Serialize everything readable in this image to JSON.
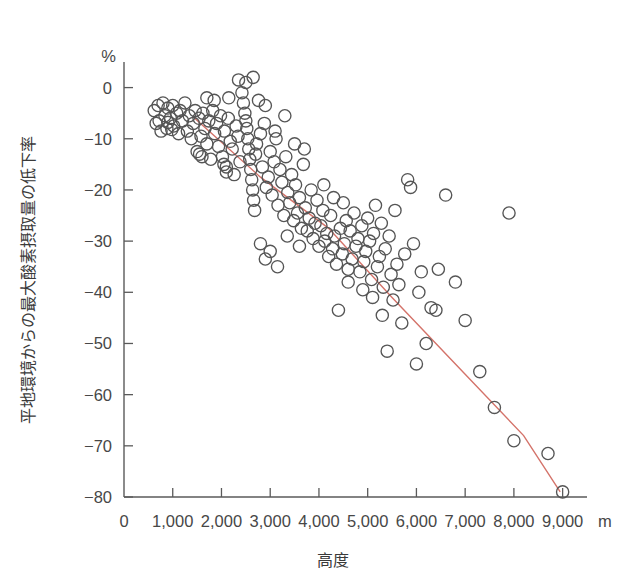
{
  "chart_data": {
    "type": "scatter",
    "title": "",
    "xlabel": "高度",
    "ylabel": "平地環境からの最大酸素摂取量の低下率",
    "x_unit": "m",
    "y_unit": "%",
    "xlim": [
      0,
      9500
    ],
    "ylim": [
      -80,
      5
    ],
    "grid": false,
    "legend": "none",
    "x_ticks": [
      0,
      1000,
      2000,
      3000,
      4000,
      5000,
      6000,
      7000,
      8000,
      9000
    ],
    "x_tick_labels": [
      "0",
      "1,000",
      "2,000",
      "3,000",
      "4,000",
      "5,000",
      "6,000",
      "7,000",
      "8,000",
      "9,000"
    ],
    "y_ticks": [
      0,
      -10,
      -20,
      -30,
      -40,
      -50,
      -60,
      -70,
      -80
    ],
    "y_tick_labels": [
      "0",
      "-10",
      "-20",
      "-30",
      "-40",
      "-50",
      "-60",
      "-70",
      "-80"
    ],
    "series": [
      {
        "name": "最大酸素摂取量低下率",
        "marker": "open-circle",
        "marker_color": "#555555",
        "points": [
          [
            620,
            -4.5
          ],
          [
            660,
            -7.0
          ],
          [
            700,
            -3.5
          ],
          [
            720,
            -6.5
          ],
          [
            760,
            -8.5
          ],
          [
            800,
            -3.0
          ],
          [
            840,
            -5.5
          ],
          [
            880,
            -8.0
          ],
          [
            900,
            -4.0
          ],
          [
            950,
            -6.0
          ],
          [
            1000,
            -3.5
          ],
          [
            1020,
            -7.5
          ],
          [
            1080,
            -5.0
          ],
          [
            1120,
            -9.0
          ],
          [
            1150,
            -4.5
          ],
          [
            1200,
            -6.5
          ],
          [
            1250,
            -3.0
          ],
          [
            1300,
            -8.5
          ],
          [
            1340,
            -5.5
          ],
          [
            1380,
            -10.0
          ],
          [
            1420,
            -7.0
          ],
          [
            1460,
            -4.5
          ],
          [
            1500,
            -12.5
          ],
          [
            1540,
            -6.0
          ],
          [
            1580,
            -9.5
          ],
          [
            1620,
            -5.0
          ],
          [
            1660,
            -8.0
          ],
          [
            1700,
            -11.0
          ],
          [
            1740,
            -6.5
          ],
          [
            1780,
            -14.0
          ],
          [
            1820,
            -4.5
          ],
          [
            1860,
            -9.0
          ],
          [
            1900,
            -7.0
          ],
          [
            1940,
            -11.5
          ],
          [
            1980,
            -5.5
          ],
          [
            2020,
            -13.5
          ],
          [
            2060,
            -8.5
          ],
          [
            2100,
            -16.5
          ],
          [
            2140,
            -6.0
          ],
          [
            2180,
            -10.5
          ],
          [
            2220,
            -12.0
          ],
          [
            2260,
            -17.0
          ],
          [
            2300,
            -7.5
          ],
          [
            2340,
            -9.5
          ],
          [
            2380,
            -14.5
          ],
          [
            2420,
            -1.0
          ],
          [
            2450,
            -3.0
          ],
          [
            2480,
            -5.0
          ],
          [
            2500,
            -6.5
          ],
          [
            2520,
            -8.0
          ],
          [
            2540,
            -10.0
          ],
          [
            2560,
            -12.0
          ],
          [
            2580,
            -14.0
          ],
          [
            2600,
            -16.0
          ],
          [
            2620,
            -18.0
          ],
          [
            2640,
            -20.0
          ],
          [
            2660,
            -22.0
          ],
          [
            2680,
            -24.0
          ],
          [
            2700,
            -13.0
          ],
          [
            2720,
            -11.0
          ],
          [
            2760,
            -2.5
          ],
          [
            2800,
            -9.0
          ],
          [
            2840,
            -15.5
          ],
          [
            2880,
            -7.0
          ],
          [
            2920,
            -19.5
          ],
          [
            2960,
            -17.5
          ],
          [
            3000,
            -12.5
          ],
          [
            3040,
            -21.0
          ],
          [
            3080,
            -14.5
          ],
          [
            3120,
            -10.0
          ],
          [
            3160,
            -23.0
          ],
          [
            3200,
            -16.0
          ],
          [
            3240,
            -18.5
          ],
          [
            3280,
            -25.0
          ],
          [
            3320,
            -13.5
          ],
          [
            3360,
            -20.5
          ],
          [
            3400,
            -22.5
          ],
          [
            3440,
            -17.0
          ],
          [
            3480,
            -26.0
          ],
          [
            3520,
            -19.0
          ],
          [
            3560,
            -24.5
          ],
          [
            3600,
            -21.5
          ],
          [
            3640,
            -27.5
          ],
          [
            3680,
            -15.0
          ],
          [
            3720,
            -23.5
          ],
          [
            3760,
            -28.0
          ],
          [
            3800,
            -25.5
          ],
          [
            3840,
            -20.0
          ],
          [
            3880,
            -29.5
          ],
          [
            3920,
            -26.5
          ],
          [
            3960,
            -22.0
          ],
          [
            4000,
            -31.0
          ],
          [
            4040,
            -27.0
          ],
          [
            4080,
            -24.0
          ],
          [
            4120,
            -30.0
          ],
          [
            4160,
            -28.5
          ],
          [
            4200,
            -33.0
          ],
          [
            4240,
            -25.0
          ],
          [
            4280,
            -31.5
          ],
          [
            4320,
            -29.0
          ],
          [
            4360,
            -34.5
          ],
          [
            4400,
            -43.5
          ],
          [
            4440,
            -27.5
          ],
          [
            4480,
            -32.5
          ],
          [
            4520,
            -30.5
          ],
          [
            4560,
            -26.0
          ],
          [
            4600,
            -35.5
          ],
          [
            4640,
            -28.0
          ],
          [
            4680,
            -33.5
          ],
          [
            4720,
            -24.5
          ],
          [
            4760,
            -31.0
          ],
          [
            4800,
            -29.5
          ],
          [
            4840,
            -36.0
          ],
          [
            4880,
            -27.0
          ],
          [
            4920,
            -34.0
          ],
          [
            4960,
            -32.0
          ],
          [
            5000,
            -25.5
          ],
          [
            5040,
            -30.0
          ],
          [
            5080,
            -37.5
          ],
          [
            5120,
            -28.5
          ],
          [
            5160,
            -23.0
          ],
          [
            5200,
            -35.0
          ],
          [
            5240,
            -33.0
          ],
          [
            5280,
            -26.5
          ],
          [
            5320,
            -39.0
          ],
          [
            5360,
            -31.5
          ],
          [
            5400,
            -51.5
          ],
          [
            5440,
            -29.0
          ],
          [
            5480,
            -36.5
          ],
          [
            5520,
            -41.5
          ],
          [
            5560,
            -24.0
          ],
          [
            5600,
            -34.5
          ],
          [
            5640,
            -38.5
          ],
          [
            5700,
            -46.0
          ],
          [
            5760,
            -32.5
          ],
          [
            5820,
            -18.0
          ],
          [
            5880,
            -19.5
          ],
          [
            5940,
            -30.5
          ],
          [
            6000,
            -54.0
          ],
          [
            6050,
            -40.0
          ],
          [
            6100,
            -36.0
          ],
          [
            6200,
            -50.0
          ],
          [
            6300,
            -43.0
          ],
          [
            6400,
            -43.5
          ],
          [
            6450,
            -35.5
          ],
          [
            6600,
            -21.0
          ],
          [
            6800,
            -38.0
          ],
          [
            7000,
            -45.5
          ],
          [
            7300,
            -55.5
          ],
          [
            7600,
            -62.5
          ],
          [
            7900,
            -24.5
          ],
          [
            8000,
            -69.0
          ],
          [
            8700,
            -71.5
          ],
          [
            9000,
            -79.0
          ],
          [
            1700,
            -2.0
          ],
          [
            1850,
            -2.5
          ],
          [
            2150,
            -2.0
          ],
          [
            2350,
            1.5
          ],
          [
            2500,
            1.0
          ],
          [
            2650,
            2.0
          ],
          [
            2900,
            -3.5
          ],
          [
            3100,
            -8.5
          ],
          [
            3300,
            -5.5
          ],
          [
            2050,
            -15.0
          ],
          [
            2100,
            -15.5
          ],
          [
            1600,
            -13.5
          ],
          [
            1550,
            -13.0
          ],
          [
            900,
            -6.8
          ],
          [
            980,
            -8.2
          ],
          [
            3500,
            -11.0
          ],
          [
            3700,
            -12.0
          ],
          [
            4100,
            -19.0
          ],
          [
            4300,
            -21.5
          ],
          [
            4500,
            -22.5
          ],
          [
            2800,
            -30.5
          ],
          [
            2900,
            -33.5
          ],
          [
            3000,
            -32.0
          ],
          [
            3150,
            -35.0
          ],
          [
            4600,
            -38.0
          ],
          [
            4900,
            -39.5
          ],
          [
            5100,
            -41.0
          ],
          [
            5300,
            -44.5
          ],
          [
            3350,
            -29.0
          ],
          [
            3600,
            -31.0
          ]
        ]
      }
    ],
    "trend_line": {
      "name": "回帰直線",
      "color": "#d4736a",
      "points": [
        [
          1450,
          -6.0
        ],
        [
          2800,
          -17.5
        ],
        [
          4200,
          -27.5
        ],
        [
          5500,
          -41.0
        ],
        [
          7000,
          -56.0
        ],
        [
          8200,
          -68.0
        ],
        [
          8950,
          -79.0
        ]
      ]
    }
  },
  "axes": {
    "y_unit_label": "%",
    "x_unit_label": "m",
    "x_axis_title": "高度",
    "y_axis_title": "平地環境からの最大酸素摂取量の低下率"
  },
  "colors": {
    "axis": "#5a5a5a",
    "marker": "#555555",
    "trend": "#d4736a",
    "text": "#474747",
    "background": "#ffffff"
  }
}
